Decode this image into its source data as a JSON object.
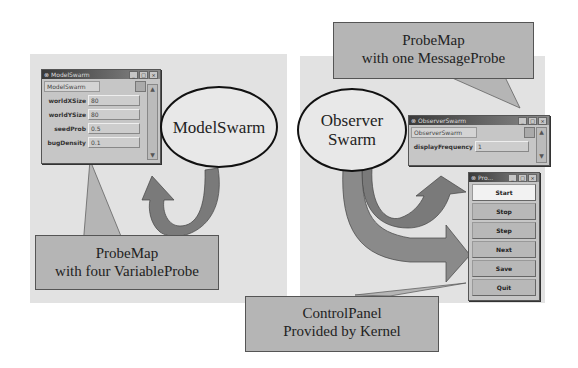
{
  "left": {
    "ellipse_label": "ModelSwarm",
    "probe_window": {
      "title": "ModelSwarm",
      "class_field": "ModelSwarm",
      "variables": [
        {
          "name": "worldXSize",
          "value": "80"
        },
        {
          "name": "worldYSize",
          "value": "80"
        },
        {
          "name": "seedProb",
          "value": "0.5"
        },
        {
          "name": "bugDensity",
          "value": "0.1"
        }
      ]
    },
    "callout": {
      "line1": "ProbeMap",
      "line2": "with four VariableProbe"
    }
  },
  "right": {
    "ellipse_line1": "Observer",
    "ellipse_line2": "Swarm",
    "probe_window": {
      "title": "ObserverSwarm",
      "class_field": "ObserverSwarm",
      "variables": [
        {
          "name": "displayFrequency",
          "value": "1"
        }
      ]
    },
    "top_callout": {
      "line1": "ProbeMap",
      "line2": "with one MessageProbe"
    },
    "control_panel": {
      "title": "Pro...",
      "buttons": [
        "Start",
        "Stop",
        "Step",
        "Next",
        "Save",
        "Quit"
      ]
    },
    "bottom_callout": {
      "line1": "ControlPanel",
      "line2": "Provided by Kernel"
    }
  },
  "window_controls": {
    "minimize": "_",
    "maximize": "□",
    "close": "×"
  },
  "colors": {
    "panel_bg": "#e2e2e2",
    "callout_bg": "#b5b5b5",
    "arrow_dark": "#6e6e6e",
    "arrow_light": "#8e8e8e"
  }
}
